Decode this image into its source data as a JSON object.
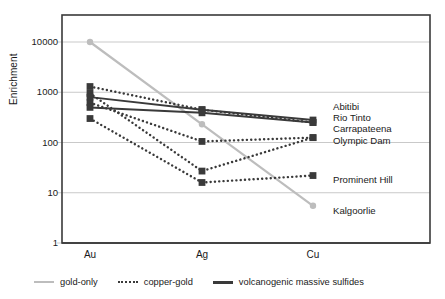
{
  "chart_data": {
    "type": "line",
    "title": "",
    "xlabel": "",
    "ylabel": "Enrichment",
    "categories": [
      "Au",
      "Ag",
      "Cu"
    ],
    "x_positions": [
      90,
      202,
      313
    ],
    "yscale": "log",
    "ylim": [
      1,
      10000
    ],
    "yticks": [
      1,
      10,
      100,
      1000,
      10000
    ],
    "ytick_labels": [
      "1",
      "10",
      "100",
      "1000",
      "10000"
    ],
    "grid": "horizontal",
    "legend_position": "bottom",
    "legend": [
      {
        "label": "gold-only",
        "style": "solid",
        "color": "#bdbdbd"
      },
      {
        "label": "copper-gold",
        "style": "dotted",
        "color": "#3a3a3a"
      },
      {
        "label": "volcanogenic massive sulfides",
        "style": "solid",
        "color": "#3a3a3a"
      }
    ],
    "series": [
      {
        "name": "Kalgoorlie",
        "group": "gold-only",
        "style": "solid",
        "color": "#bdbdbd",
        "marker": "circle",
        "values": [
          10000,
          230,
          5.5
        ]
      },
      {
        "name": "Abitibi",
        "group": "volcanogenic massive sulfides",
        "style": "solid",
        "color": "#3a3a3a",
        "marker": "square",
        "values": [
          800,
          450,
          280
        ]
      },
      {
        "name": "Rio Tinto",
        "group": "volcanogenic massive sulfides",
        "style": "solid",
        "color": "#3a3a3a",
        "marker": "square",
        "values": [
          500,
          390,
          250
        ]
      },
      {
        "name": "Carrapateena",
        "group": "copper-gold",
        "style": "dotted",
        "color": "#3a3a3a",
        "marker": "square",
        "values": [
          1300,
          450,
          250
        ]
      },
      {
        "name": "Olympic Dam",
        "group": "copper-gold",
        "style": "dotted",
        "color": "#3a3a3a",
        "marker": "square",
        "values": [
          620,
          105,
          125
        ]
      },
      {
        "name": "Prominent Hill",
        "group": "copper-gold",
        "style": "dotted",
        "color": "#3a3a3a",
        "marker": "square",
        "values": [
          300,
          16,
          22
        ]
      },
      {
        "name": "unlabeled-copper-gold",
        "group": "copper-gold",
        "style": "dotted",
        "color": "#3a3a3a",
        "marker": "square",
        "values": [
          950,
          27,
          125
        ]
      }
    ],
    "right_labels": [
      {
        "text": "Abitibi",
        "y": 107
      },
      {
        "text": "Rio Tinto",
        "y": 118
      },
      {
        "text": "Carrapateena",
        "y": 129
      },
      {
        "text": "Olympic Dam",
        "y": 141
      },
      {
        "text": "Prominent Hill",
        "y": 180
      },
      {
        "text": "Kalgoorlie",
        "y": 211
      }
    ]
  },
  "colors": {
    "gold_only": "#bdbdbd",
    "dark_line": "#3a3a3a",
    "grid": "#c9c9c9",
    "axis": "#3a3a3a",
    "text": "#1a1a1a",
    "background": "#ffffff"
  }
}
